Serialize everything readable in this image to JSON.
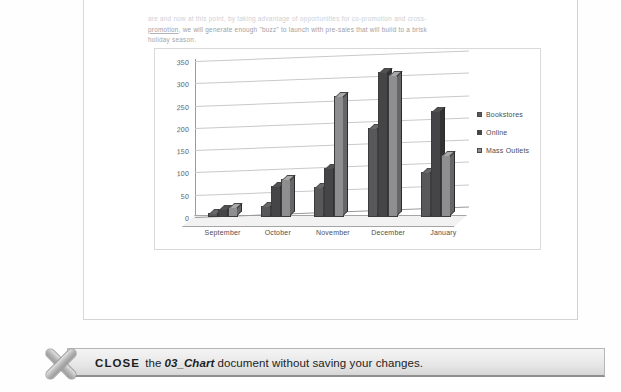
{
  "document": {
    "paragraph_line1": "are and now at this point, by taking advantage of opportunities for co-promotion and cross-",
    "paragraph_line2": "promotion, we will generate enough \"buzz\" to launch with pre-sales that will build to a brisk",
    "paragraph_line3": "holiday season."
  },
  "chart_data": {
    "type": "bar",
    "title": "",
    "xlabel": "",
    "ylabel": "",
    "ylim": [
      0,
      350
    ],
    "yticks": [
      0,
      50,
      100,
      150,
      200,
      250,
      300,
      350
    ],
    "grid": true,
    "legend_position": "right",
    "categories": [
      "September",
      "October",
      "November",
      "December",
      "January"
    ],
    "series": [
      {
        "name": "Bookstores",
        "color": "#58585a",
        "values": [
          8,
          25,
          67,
          200,
          100
        ]
      },
      {
        "name": "Online",
        "color": "#454547",
        "values": [
          18,
          70,
          110,
          325,
          237
        ]
      },
      {
        "name": "Mass Outlets",
        "color": "#8e8e90",
        "values": [
          22,
          85,
          272,
          318,
          140
        ]
      }
    ]
  },
  "instruction": {
    "keyword": "CLOSE",
    "text_before": "the",
    "document_name": "03_Chart",
    "text_after": "document without saving your changes.",
    "icon": "x-mark-icon"
  }
}
